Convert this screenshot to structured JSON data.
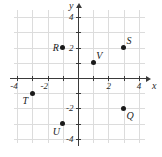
{
  "figure": {
    "axis_labels": {
      "x": "x",
      "y": "y"
    },
    "x_tick_labels": [
      "-4",
      "-2",
      "2",
      "4"
    ],
    "y_tick_labels": [
      "4",
      "2",
      "-2",
      "-4"
    ],
    "colors": {
      "grid": "#dcdcdc",
      "axis": "#3a3a3a",
      "point": "#1a1a1a",
      "background": "#ffffff"
    }
  },
  "chart_data": {
    "type": "scatter",
    "title": "",
    "xlabel": "x",
    "ylabel": "y",
    "xlim": [
      -5,
      5
    ],
    "ylim": [
      -5,
      5
    ],
    "xticks": [
      -4,
      -2,
      2,
      4
    ],
    "yticks": [
      4,
      2,
      -2,
      -4
    ],
    "grid": true,
    "legend": false,
    "points": [
      {
        "label": "R",
        "x": -1,
        "y": 2,
        "label_pos": "left"
      },
      {
        "label": "S",
        "x": 3,
        "y": 2,
        "label_pos": "upper-right"
      },
      {
        "label": "V",
        "x": 1,
        "y": 1,
        "label_pos": "upper-right"
      },
      {
        "label": "T",
        "x": -3,
        "y": -1,
        "label_pos": "lower-left"
      },
      {
        "label": "U",
        "x": -1,
        "y": -3,
        "label_pos": "lower-left"
      },
      {
        "label": "Q",
        "x": 3,
        "y": -2,
        "label_pos": "lower-right"
      }
    ]
  }
}
